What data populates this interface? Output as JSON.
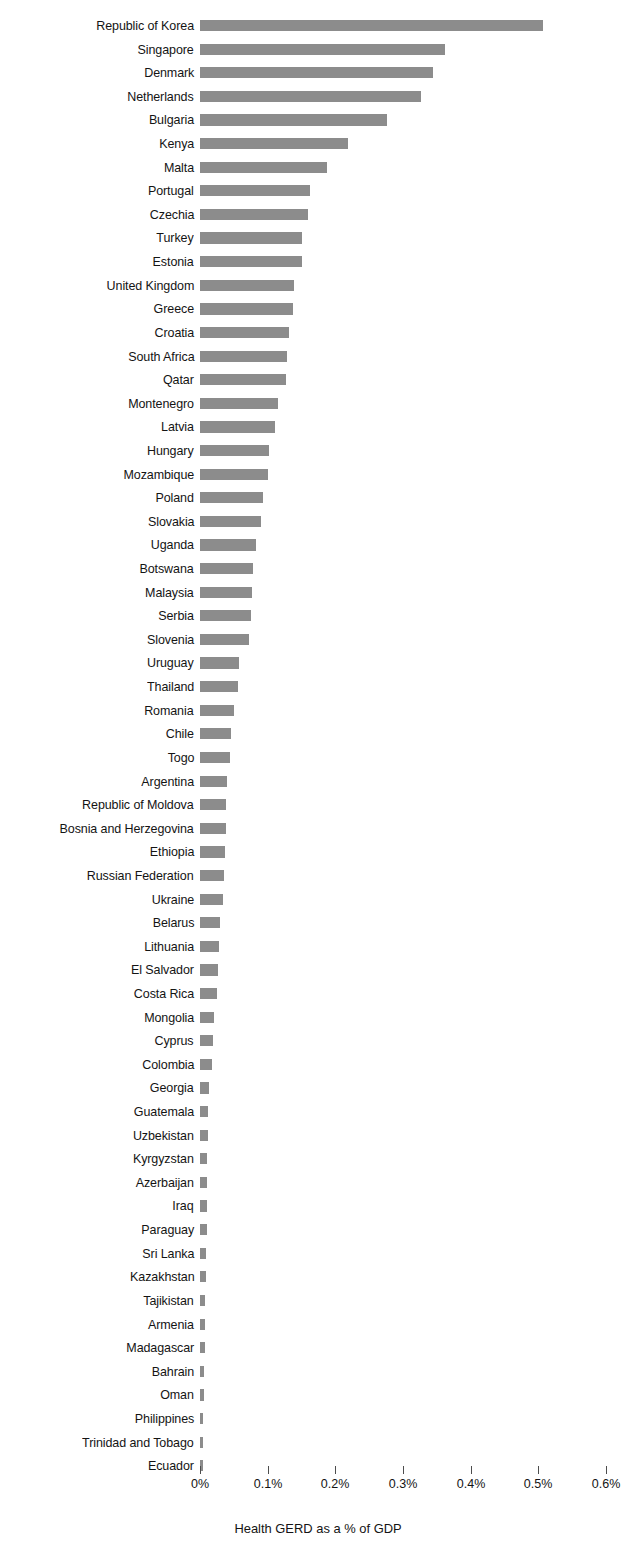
{
  "chart_data": {
    "type": "bar",
    "orientation": "horizontal",
    "title": "",
    "subtitle": "",
    "xlabel": "Health GERD as a % of GDP",
    "ylabel": "",
    "xlim": [
      0,
      0.6
    ],
    "xticks": [
      0,
      0.1,
      0.2,
      0.3,
      0.4,
      0.5,
      0.6
    ],
    "xticklabels": [
      "0%",
      "0.1%",
      "0.2%",
      "0.3%",
      "0.4%",
      "0.5%",
      "0.6%"
    ],
    "grid": false,
    "legend": null,
    "bar_color": "#8c8c8c",
    "text_color": "#141414",
    "background": "#ffffff",
    "categories": [
      "Republic of Korea",
      "Singapore",
      "Denmark",
      "Netherlands",
      "Bulgaria",
      "Kenya",
      "Malta",
      "Portugal",
      "Czechia",
      "Turkey",
      "Estonia",
      "United Kingdom",
      "Greece",
      "Croatia",
      "South Africa",
      "Qatar",
      "Montenegro",
      "Latvia",
      "Hungary",
      "Mozambique",
      "Poland",
      "Slovakia",
      "Uganda",
      "Botswana",
      "Malaysia",
      "Serbia",
      "Slovenia",
      "Uruguay",
      "Thailand",
      "Romania",
      "Chile",
      "Togo",
      "Argentina",
      "Republic of Moldova",
      "Bosnia and Herzegovina",
      "Ethiopia",
      "Russian Federation",
      "Ukraine",
      "Belarus",
      "Lithuania",
      "El Salvador",
      "Costa Rica",
      "Mongolia",
      "Cyprus",
      "Colombia",
      "Georgia",
      "Guatemala",
      "Uzbekistan",
      "Kyrgyzstan",
      "Azerbaijan",
      "Iraq",
      "Paraguay",
      "Sri Lanka",
      "Kazakhstan",
      "Tajikistan",
      "Armenia",
      "Madagascar",
      "Bahrain",
      "Oman",
      "Philippines",
      "Trinidad and Tobago",
      "Ecuador"
    ],
    "values": [
      0.507,
      0.362,
      0.344,
      0.326,
      0.277,
      0.218,
      0.188,
      0.163,
      0.159,
      0.151,
      0.15,
      0.139,
      0.138,
      0.131,
      0.128,
      0.127,
      0.115,
      0.111,
      0.102,
      0.1,
      0.093,
      0.09,
      0.083,
      0.079,
      0.077,
      0.075,
      0.073,
      0.058,
      0.056,
      0.05,
      0.046,
      0.044,
      0.04,
      0.039,
      0.038,
      0.037,
      0.036,
      0.034,
      0.029,
      0.028,
      0.027,
      0.025,
      0.02,
      0.019,
      0.017,
      0.013,
      0.012,
      0.012,
      0.011,
      0.011,
      0.01,
      0.01,
      0.009,
      0.009,
      0.007,
      0.007,
      0.007,
      0.006,
      0.006,
      0.005,
      0.005,
      0.004
    ],
    "value_unit": "%"
  }
}
